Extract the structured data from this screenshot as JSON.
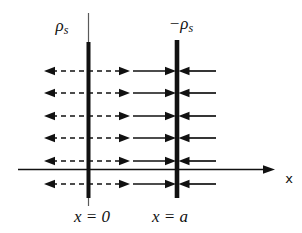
{
  "figure": {
    "background": "#ffffff",
    "ink_color": "#111111",
    "labels": {
      "positive_plane_density": {
        "base": "ρ",
        "sub": "s"
      },
      "negative_plane_density": {
        "base": "−ρ",
        "sub": "s"
      },
      "positive_plane_position": "x = 0",
      "negative_plane_position": "x = a",
      "axis": "x"
    },
    "field_line_rows": 6
  }
}
